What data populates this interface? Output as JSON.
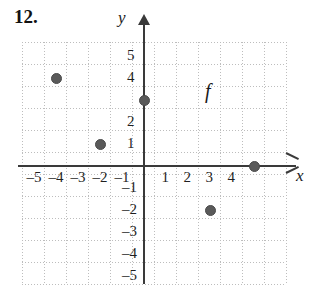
{
  "exercise": {
    "number": "12."
  },
  "function_label": "f",
  "axes": {
    "x_name": "x",
    "y_name": "y",
    "x_tick_labels": [
      "–5",
      "–4",
      "–3",
      "–2",
      "–1",
      "1",
      "2",
      "3",
      "4"
    ],
    "y_tick_labels_positive": [
      "5",
      "4",
      "2",
      "1"
    ],
    "y_tick_labels_negative": [
      "–1",
      "–2",
      "–3",
      "–4",
      "–5"
    ]
  },
  "colors": {
    "point": "#5a5a5a",
    "axis": "#3a3a3a",
    "grid": "#bdbdbd",
    "text": "#1a1a1a",
    "background": "#ffffff"
  },
  "chart_data": {
    "type": "scatter",
    "title": "",
    "xlabel": "x",
    "ylabel": "y",
    "series": [
      {
        "name": "f",
        "points": [
          {
            "x": -4,
            "y": 4
          },
          {
            "x": -2,
            "y": 1
          },
          {
            "x": 0,
            "y": 3
          },
          {
            "x": 3,
            "y": -2
          },
          {
            "x": 5,
            "y": 0
          }
        ]
      }
    ],
    "xlim": [
      -5.5,
      6.5
    ],
    "ylim": [
      -5.6,
      5.5
    ],
    "xticks": [
      -5,
      -4,
      -3,
      -2,
      -1,
      1,
      2,
      3,
      4
    ],
    "yticks": [
      5,
      4,
      3,
      2,
      1,
      -1,
      -2,
      -3,
      -4,
      -5
    ],
    "grid": true,
    "legend_position": "none",
    "annotations": [
      {
        "text": "f",
        "x": 2.8,
        "y": 3.7
      },
      {
        "text": "12.",
        "x": -5.5,
        "y": 6.2
      }
    ]
  }
}
